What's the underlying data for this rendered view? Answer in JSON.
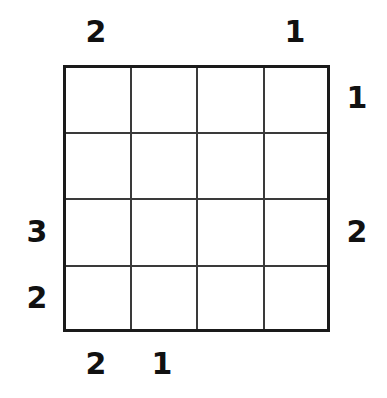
{
  "puzzle": {
    "type": "skyscrapers-grid",
    "rows": 4,
    "cols": 4,
    "background_color": "#ffffff",
    "border_color": "#1a1a1a",
    "line_color": "#3a3a3a",
    "number_color": "#111111",
    "cells": [
      [
        "",
        "",
        "",
        ""
      ],
      [
        "",
        "",
        "",
        ""
      ],
      [
        "",
        "",
        "",
        ""
      ],
      [
        "",
        "",
        "",
        ""
      ]
    ],
    "clues": {
      "top": [
        "2",
        "",
        "",
        "1"
      ],
      "right": [
        "1",
        "",
        "2",
        ""
      ],
      "bottom": [
        "2",
        "1",
        "",
        ""
      ],
      "left": [
        "",
        "",
        "3",
        "2"
      ]
    }
  }
}
